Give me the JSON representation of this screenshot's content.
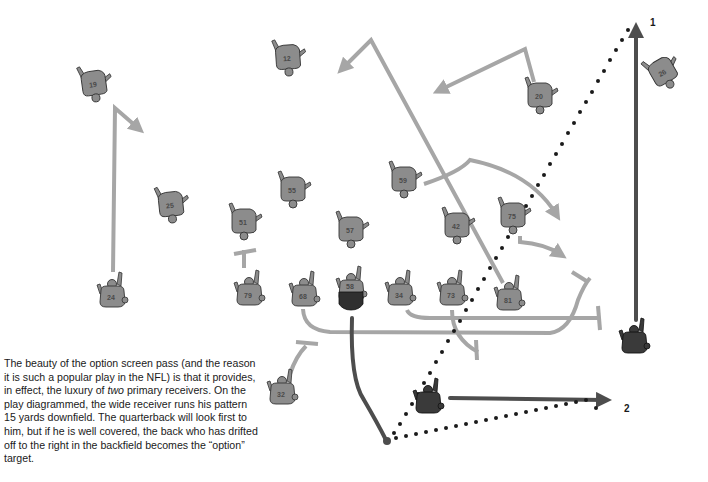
{
  "caption": {
    "part1": "The beauty of the option screen pass (and the reason it is such a popular play in the NFL) is that it provides, in effect, the luxury of ",
    "emphasis": "two",
    "part2": " primary receivers. On the play diagrammed, the wide receiver runs his pattern 15 yards downfield. The quarterback will look first to him, but if he is well covered, the back who has drifted off to the right in the backfield becomes the “option” target."
  },
  "route_labels": {
    "primary": "1",
    "option": "2"
  },
  "colors": {
    "defense_route": "#a6a6a6",
    "offense_route": "#4d4d4d",
    "defense_player": "#8c8c8c",
    "offense_player": "#3a3a3a",
    "pass_path": "#1a1a1a",
    "background": "#ffffff"
  },
  "defense_players": [
    {
      "number": "19",
      "x": 94,
      "y": 84
    },
    {
      "number": "12",
      "x": 288,
      "y": 58
    },
    {
      "number": "20",
      "x": 540,
      "y": 96
    },
    {
      "number": "26",
      "x": 663,
      "y": 72
    },
    {
      "number": "25",
      "x": 171,
      "y": 205
    },
    {
      "number": "51",
      "x": 244,
      "y": 222
    },
    {
      "number": "55",
      "x": 293,
      "y": 190
    },
    {
      "number": "57",
      "x": 351,
      "y": 230
    },
    {
      "number": "59",
      "x": 404,
      "y": 180
    },
    {
      "number": "42",
      "x": 457,
      "y": 226
    },
    {
      "number": "75",
      "x": 513,
      "y": 216
    },
    {
      "number": "24",
      "x": 112,
      "y": 294
    },
    {
      "number": "79",
      "x": 249,
      "y": 292
    },
    {
      "number": "68",
      "x": 304,
      "y": 293
    },
    {
      "number": "34",
      "x": 400,
      "y": 292
    },
    {
      "number": "73",
      "x": 452,
      "y": 292
    },
    {
      "number": "81",
      "x": 509,
      "y": 297
    },
    {
      "number": "32",
      "x": 282,
      "y": 391
    }
  ],
  "offense_players": [
    {
      "role": "center",
      "number": "58",
      "x": 351,
      "y": 288
    },
    {
      "role": "wide-receiver",
      "number": "",
      "x": 634,
      "y": 340
    },
    {
      "role": "running-back",
      "number": "",
      "x": 428,
      "y": 400
    }
  ],
  "quarterback_dropback": {
    "x": 387,
    "y": 441
  }
}
